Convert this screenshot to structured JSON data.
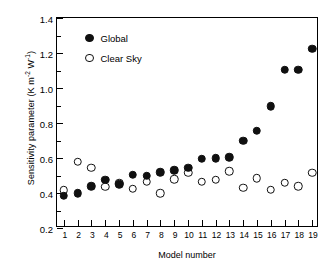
{
  "chart_data": {
    "type": "scatter",
    "title": "",
    "xlabel": "Model number",
    "ylabel": "Sensitivity parameter (K m-2 W-1)",
    "ylabel_parts": {
      "prefix": "Sensitivity parameter (K m",
      "sup1": "-2",
      "mid": " W",
      "sup2": "-1",
      "suffix": ")"
    },
    "categories": [
      1,
      2,
      3,
      4,
      5,
      6,
      7,
      8,
      9,
      10,
      11,
      12,
      13,
      14,
      15,
      16,
      17,
      18,
      19
    ],
    "x": [
      1,
      2,
      3,
      4,
      5,
      6,
      7,
      8,
      9,
      10,
      11,
      12,
      13,
      14,
      15,
      16,
      17,
      18,
      19
    ],
    "xlim": [
      0.5,
      19.5
    ],
    "ylim": [
      0.2,
      1.4
    ],
    "yticks": [
      0.2,
      0.4,
      0.6,
      0.8,
      1.0,
      1.2,
      1.4
    ],
    "ytick_labels": [
      "0.2",
      "0.4",
      "0.6",
      "0.8",
      "1.0",
      "1.2",
      "1.4"
    ],
    "ytick_minor": [
      0.3,
      0.5,
      0.7,
      0.9,
      1.1,
      1.3
    ],
    "xtick_labels": [
      "1",
      "2",
      "3",
      "4",
      "5",
      "6",
      "7",
      "8",
      "9",
      "10",
      "11",
      "12",
      "13",
      "14",
      "15",
      "16",
      "17",
      "18",
      "19"
    ],
    "grid": false,
    "legend_position": "top-left",
    "series": [
      {
        "name": "Global",
        "marker": "filled-circle",
        "color": "#101010",
        "values": [
          0.385,
          0.4,
          0.44,
          0.475,
          0.45,
          0.505,
          0.5,
          0.52,
          0.53,
          0.545,
          0.595,
          0.6,
          0.605,
          0.7,
          0.755,
          0.895,
          1.105,
          1.105,
          1.225
        ]
      },
      {
        "name": "Clear Sky",
        "marker": "open-circle",
        "color": "#ffffff",
        "values": [
          0.415,
          0.58,
          0.545,
          0.435,
          0.455,
          0.425,
          0.465,
          0.4,
          0.48,
          0.515,
          0.465,
          0.475,
          0.525,
          0.43,
          0.485,
          0.42,
          0.46,
          0.44,
          0.515
        ]
      }
    ]
  },
  "legend": {
    "items": [
      {
        "label": "Global",
        "marker": "filled-circle"
      },
      {
        "label": "Clear Sky",
        "marker": "open-circle"
      }
    ]
  }
}
